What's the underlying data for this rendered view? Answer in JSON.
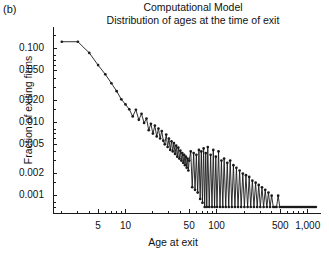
{
  "panel": {
    "label": "(b)"
  },
  "titles": {
    "line1": "Computational Model",
    "line2": "Distribution of ages at the time of exit"
  },
  "chart_data": {
    "type": "line",
    "title": "Computational Model",
    "subtitle": "Distribution of ages at the time of exit",
    "xlabel": "Age at exit",
    "ylabel": "Fraction of exiting firms",
    "xscale": "log",
    "yscale": "log",
    "xlim": [
      1.6,
      1400
    ],
    "ylim": [
      0.00058,
      0.175
    ],
    "grid": false,
    "legend": null,
    "marker": "filled-circle",
    "line_color": "#1a1a1a",
    "xticks": [
      5,
      10,
      50,
      100,
      500,
      1000
    ],
    "xtick_labels": [
      "5",
      "10",
      "50",
      "100",
      "500",
      "1,000"
    ],
    "yticks": [
      0.1,
      0.05,
      0.02,
      0.01,
      0.005,
      0.002,
      0.001
    ],
    "ytick_labels": [
      "0.100",
      "0.050",
      "0.020",
      "0.010",
      "0.005",
      "0.002",
      "0.001"
    ],
    "x": [
      2,
      3,
      4,
      5,
      6,
      7,
      8,
      9,
      10,
      11,
      12,
      13,
      14,
      15,
      16,
      17,
      18,
      19,
      20,
      21,
      22,
      23,
      24,
      25,
      26,
      27,
      28,
      29,
      30,
      31,
      32,
      33,
      34,
      35,
      36,
      37,
      38,
      39,
      40,
      41,
      42,
      43,
      44,
      45,
      46,
      47,
      48,
      49,
      50,
      52,
      54,
      56,
      58,
      60,
      62,
      64,
      66,
      68,
      70,
      72,
      74,
      76,
      78,
      80,
      83,
      86,
      89,
      92,
      95,
      98,
      101,
      105,
      109,
      113,
      117,
      121,
      126,
      131,
      136,
      141,
      147,
      153,
      159,
      165,
      172,
      179,
      186,
      194,
      202,
      210,
      219,
      228,
      237,
      247,
      257,
      268,
      279,
      290,
      302,
      315,
      328,
      342,
      356,
      371,
      386,
      402,
      419,
      437,
      455,
      474,
      494,
      515,
      537,
      560,
      583,
      608,
      634,
      660,
      688,
      717,
      747,
      779,
      812,
      846,
      882,
      919,
      958,
      998,
      1040,
      1084,
      1130,
      1178,
      1228
    ],
    "y": [
      0.125,
      0.125,
      0.088,
      0.06,
      0.045,
      0.034,
      0.0265,
      0.0205,
      0.0175,
      0.015,
      0.012,
      0.0148,
      0.0108,
      0.013,
      0.0098,
      0.0112,
      0.0078,
      0.0095,
      0.007,
      0.009,
      0.0064,
      0.0082,
      0.006,
      0.0076,
      0.0056,
      0.005,
      0.0068,
      0.0046,
      0.006,
      0.0042,
      0.0055,
      0.004,
      0.0052,
      0.0037,
      0.0048,
      0.0034,
      0.0045,
      0.0032,
      0.0041,
      0.003,
      0.0038,
      0.0028,
      0.0036,
      0.0026,
      0.0034,
      0.0024,
      0.0032,
      0.0022,
      0.003,
      0.004,
      0.0013,
      0.0038,
      0.0012,
      0.0036,
      0.0011,
      0.0042,
      0.0009,
      0.004,
      0.0008,
      0.0044,
      0.0007,
      0.0038,
      0.0007,
      0.0046,
      0.0007,
      0.0036,
      0.0007,
      0.0042,
      0.0007,
      0.0034,
      0.0007,
      0.004,
      0.0007,
      0.003,
      0.0007,
      0.0032,
      0.0007,
      0.0028,
      0.0007,
      0.003,
      0.0007,
      0.0026,
      0.0007,
      0.0024,
      0.0007,
      0.0022,
      0.0007,
      0.002,
      0.0007,
      0.0019,
      0.0007,
      0.0018,
      0.0007,
      0.0016,
      0.0007,
      0.0015,
      0.0007,
      0.0014,
      0.0007,
      0.0013,
      0.0007,
      0.0012,
      0.0007,
      0.0011,
      0.0007,
      0.001,
      0.0007,
      0.0007,
      0.0007,
      0.001,
      0.0007,
      0.0007,
      0.0007,
      0.0007,
      0.0007,
      0.0007,
      0.0007,
      0.0007,
      0.0007,
      0.0007,
      0.0007,
      0.0007,
      0.0007,
      0.0007,
      0.0007,
      0.0007,
      0.0007,
      0.0007,
      0.0007,
      0.0007,
      0.0007,
      0.0007,
      0.0007
    ]
  }
}
